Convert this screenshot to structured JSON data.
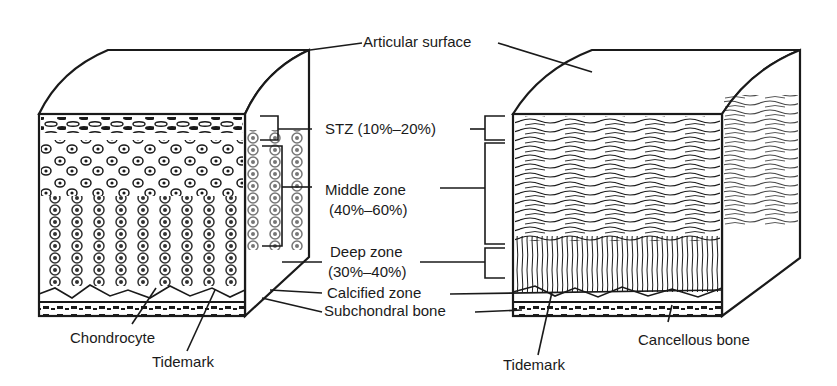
{
  "diagram": {
    "left_block": {
      "style": "cellular (chondrocytes)",
      "labels": {
        "chondrocyte": "Chondrocyte",
        "tidemark": "Tidemark"
      }
    },
    "right_block": {
      "style": "collagen fibers",
      "labels": {
        "tidemark": "Tidemark",
        "cancellous_bone": "Cancellous bone"
      }
    },
    "center_labels": {
      "articular_surface": "Articular surface",
      "stz": "STZ (10%–20%)",
      "middle_zone_line1": "Middle zone",
      "middle_zone_line2": "(40%–60%)",
      "deep_zone_line1": "Deep zone",
      "deep_zone_line2": "(30%–40%)",
      "calcified_zone": "Calcified zone",
      "subchondral_bone": "Subchondral bone"
    },
    "colors": {
      "ink": "#1a1a1a",
      "background": "#ffffff"
    }
  }
}
